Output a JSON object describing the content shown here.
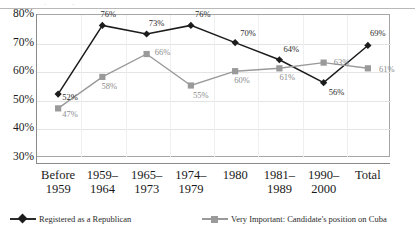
{
  "chart_data": {
    "type": "line",
    "title": "",
    "subtitle": "",
    "xlabel": "",
    "ylabel": "",
    "ylim": [
      30,
      80
    ],
    "ytick_labels": [
      "80%",
      "70%",
      "60%",
      "50%",
      "40%",
      "30%"
    ],
    "ytick_values": [
      80,
      70,
      60,
      50,
      40,
      30
    ],
    "grid": true,
    "legend_position": "bottom",
    "categories": [
      "Before\n1959",
      "1959–\n1964",
      "1965–\n1973",
      "1974–\n1979",
      "1980",
      "1981–\n1989",
      "1990–\n2000",
      "Total"
    ],
    "series": [
      {
        "name": "Registered as a Republican",
        "color": "#1c1c1c",
        "marker": "diamond",
        "values": [
          52,
          76,
          73,
          76,
          70,
          64,
          56,
          69
        ],
        "labels": [
          "52%",
          "76%",
          "73%",
          "76%",
          "70%",
          "64%",
          "56%",
          "69%"
        ]
      },
      {
        "name": "Very Important:  Candidate's position on Cuba",
        "color": "#9a9a9a",
        "marker": "square",
        "values": [
          47,
          58,
          66,
          55,
          60,
          61,
          63,
          61
        ],
        "labels": [
          "47%",
          "58%",
          "66%",
          "55%",
          "60%",
          "61%",
          "63%",
          "61%"
        ]
      }
    ]
  },
  "legend": {
    "items": [
      {
        "label": "Registered as a Republican"
      },
      {
        "label": "Very Important:  Candidate's position on Cuba"
      }
    ]
  },
  "artifacts": {
    "top_fragments": [
      ".",
      "."
    ]
  }
}
